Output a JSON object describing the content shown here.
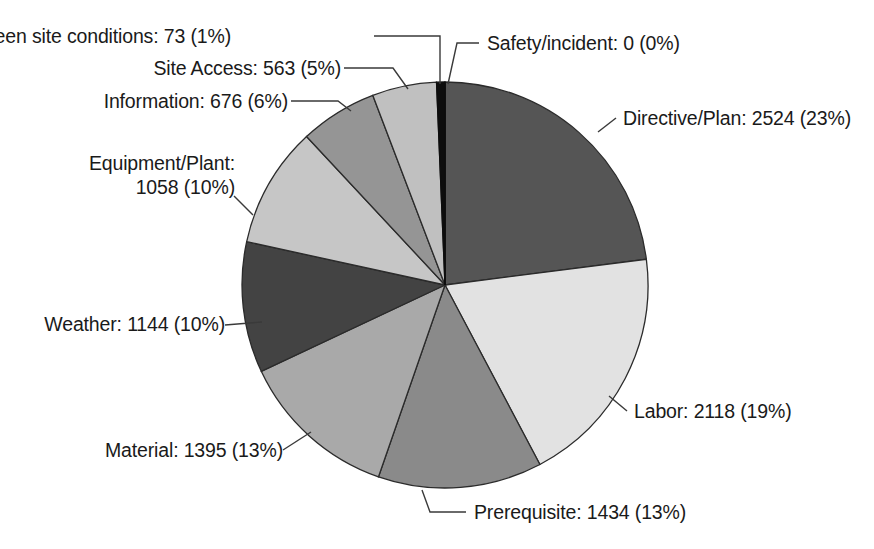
{
  "chart_data": {
    "type": "pie",
    "title": "",
    "subtitle": "",
    "xlabel": "",
    "ylabel": "",
    "legend_position": "none",
    "grid": false,
    "total": 10985,
    "start_angle_deg": 0,
    "direction": "clockwise",
    "categories": [
      "Safety/incident",
      "Directive/Plan",
      "Labor",
      "Prerequisite",
      "Material",
      "Weather",
      "Equipment/Plant",
      "Information",
      "Site Access",
      "Unforseen site conditions"
    ],
    "values": [
      0,
      2524,
      2118,
      1434,
      1395,
      1144,
      1058,
      676,
      563,
      73
    ],
    "percents": [
      0,
      23,
      19,
      13,
      13,
      10,
      10,
      6,
      5,
      1
    ],
    "colors": [
      "#0d0d0d",
      "#555555",
      "#e2e2e2",
      "#8a8a8a",
      "#a9a9a9",
      "#434343",
      "#c6c6c6",
      "#959595",
      "#c0c0c0",
      "#0d0d0d"
    ],
    "slices": [
      {
        "name": "Safety/incident",
        "value": 0,
        "percent": 0,
        "label": "Safety/incident: 0 (0%)",
        "color": "#0d0d0d"
      },
      {
        "name": "Directive/Plan",
        "value": 2524,
        "percent": 23,
        "label": "Directive/Plan: 2524 (23%)",
        "color": "#555555"
      },
      {
        "name": "Labor",
        "value": 2118,
        "percent": 19,
        "label": "Labor: 2118 (19%)",
        "color": "#e2e2e2"
      },
      {
        "name": "Prerequisite",
        "value": 1434,
        "percent": 13,
        "label": "Prerequisite: 1434 (13%)",
        "color": "#8a8a8a"
      },
      {
        "name": "Material",
        "value": 1395,
        "percent": 13,
        "label": "Material: 1395 (13%)",
        "color": "#a9a9a9"
      },
      {
        "name": "Weather",
        "value": 1144,
        "percent": 10,
        "label": "Weather: 1144 (10%)",
        "color": "#434343"
      },
      {
        "name": "Equipment/Plant",
        "value": 1058,
        "percent": 10,
        "label_line1": "Equipment/Plant:",
        "label_line2": "1058 (10%)",
        "label": "Equipment/Plant: 1058 (10%)",
        "color": "#c6c6c6"
      },
      {
        "name": "Information",
        "value": 676,
        "percent": 6,
        "label": "Information: 676 (6%)",
        "color": "#959595"
      },
      {
        "name": "Site Access",
        "value": 563,
        "percent": 5,
        "label": "Site Access: 563 (5%)",
        "color": "#c0c0c0"
      },
      {
        "name": "Unforseen site conditions",
        "value": 73,
        "percent": 1,
        "label": "Unforseen site conditions: 73 (1%)",
        "color": "#0d0d0d"
      }
    ]
  }
}
